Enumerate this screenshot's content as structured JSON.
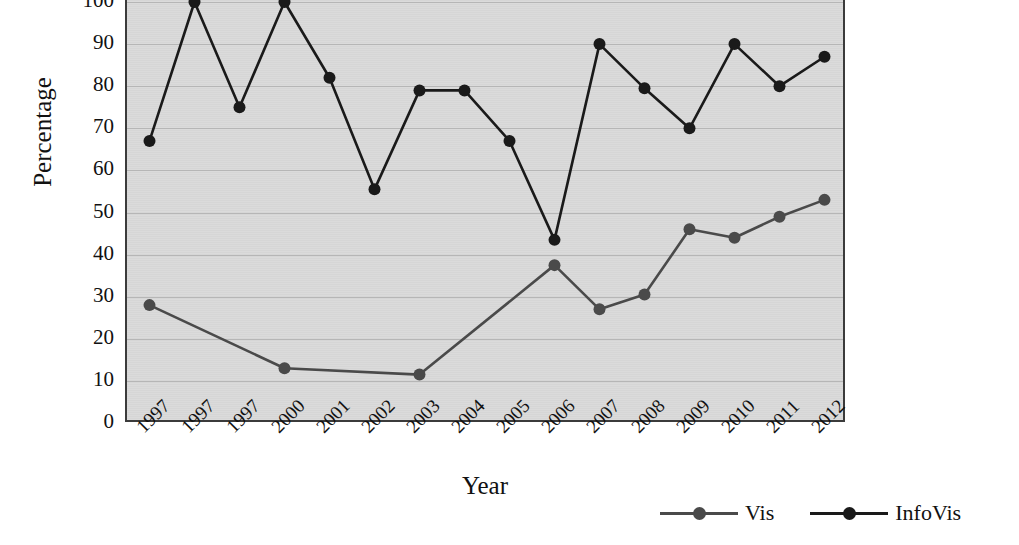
{
  "chart_data": {
    "type": "line",
    "title": "",
    "xlabel": "Year",
    "ylabel": "Percentage",
    "ylim": [
      0,
      100
    ],
    "ytick_values": [
      0,
      10,
      20,
      30,
      40,
      50,
      60,
      70,
      80,
      90,
      100
    ],
    "ytick_labels": [
      "0",
      "10",
      "20",
      "30",
      "40",
      "50",
      "60",
      "70",
      "80",
      "90",
      "100"
    ],
    "grid": "horizontal",
    "legend_position": "bottom-right",
    "categories": [
      "1997",
      "1997",
      "1997",
      "2000",
      "2001",
      "2002",
      "2003",
      "2004",
      "2005",
      "2006",
      "2007",
      "2008",
      "2009",
      "2010",
      "2011",
      "2012"
    ],
    "series": [
      {
        "name": "Vis",
        "color": "#4a4a4a",
        "values": [
          28,
          null,
          null,
          13,
          null,
          null,
          11.5,
          null,
          null,
          37.5,
          27,
          30.5,
          46,
          44,
          49,
          53
        ]
      },
      {
        "name": "InfoVis",
        "color": "#1a1a1a",
        "values": [
          67,
          100,
          75,
          100,
          82,
          55.5,
          79,
          79,
          67,
          43.5,
          90,
          79.5,
          70,
          90,
          80,
          87
        ]
      }
    ]
  },
  "legend": {
    "items": [
      {
        "label": "Vis",
        "color": "#4a4a4a"
      },
      {
        "label": "InfoVis",
        "color": "#1a1a1a"
      }
    ]
  },
  "axes": {
    "y_title": "Percentage",
    "x_title": "Year"
  },
  "colors": {
    "plot_background": "#d9d9d9",
    "page_background": "#ffffff",
    "gridline": "#b6b6b6",
    "axis_line": "#3b3b3b",
    "vis_series": "#4a4a4a",
    "infovis_series": "#1a1a1a"
  }
}
